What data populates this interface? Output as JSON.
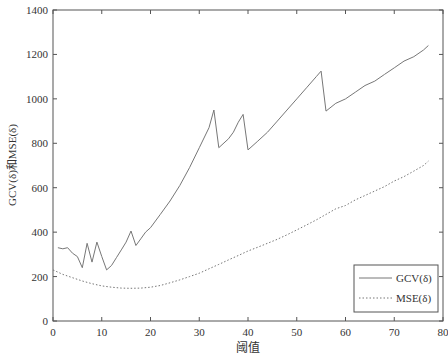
{
  "chart_data": {
    "type": "line",
    "title": "",
    "xlabel": "阈值",
    "ylabel": "GCV(δ)和MSE(δ)",
    "xlim": [
      0,
      80
    ],
    "ylim": [
      0,
      1400
    ],
    "xticks": [
      0,
      10,
      20,
      30,
      40,
      50,
      60,
      70,
      80
    ],
    "yticks": [
      0,
      200,
      400,
      600,
      800,
      1000,
      1200,
      1400
    ],
    "grid": false,
    "legend_position": "lower right",
    "series": [
      {
        "name": "GCV(δ)",
        "style": "solid",
        "x": [
          1,
          2,
          3,
          4,
          5,
          6,
          7,
          8,
          9,
          10,
          11,
          12,
          13,
          14,
          15,
          16,
          17,
          18,
          19,
          20,
          22,
          24,
          26,
          28,
          30,
          32,
          33,
          34,
          36,
          37,
          38,
          39,
          40,
          42,
          44,
          46,
          48,
          50,
          52,
          54,
          55,
          56,
          58,
          60,
          62,
          64,
          66,
          68,
          70,
          72,
          74,
          76,
          77
        ],
        "y": [
          330,
          325,
          330,
          305,
          290,
          240,
          350,
          265,
          355,
          290,
          230,
          250,
          285,
          320,
          355,
          405,
          340,
          370,
          400,
          420,
          480,
          540,
          610,
          690,
          780,
          870,
          950,
          780,
          820,
          850,
          895,
          930,
          770,
          810,
          850,
          900,
          950,
          1000,
          1050,
          1100,
          1125,
          945,
          980,
          1000,
          1030,
          1060,
          1080,
          1110,
          1140,
          1170,
          1190,
          1220,
          1240
        ]
      },
      {
        "name": "MSE(δ)",
        "style": "dotted",
        "x": [
          0,
          2,
          4,
          6,
          8,
          10,
          12,
          14,
          16,
          18,
          20,
          22,
          24,
          26,
          28,
          30,
          32,
          34,
          36,
          38,
          40,
          42,
          44,
          46,
          48,
          50,
          52,
          54,
          56,
          58,
          60,
          62,
          64,
          66,
          68,
          70,
          72,
          74,
          76,
          77
        ],
        "y": [
          230,
          210,
          195,
          180,
          168,
          158,
          152,
          148,
          147,
          148,
          152,
          160,
          172,
          185,
          200,
          215,
          235,
          255,
          275,
          295,
          315,
          332,
          350,
          368,
          388,
          410,
          432,
          455,
          480,
          505,
          520,
          545,
          565,
          585,
          605,
          630,
          650,
          675,
          700,
          720
        ]
      }
    ]
  },
  "legend": {
    "items": [
      "GCV(δ)",
      "MSE(δ)"
    ]
  },
  "axes": {
    "xlabel": "阈值",
    "ylabel": "GCV(δ)和MSE(δ)"
  }
}
